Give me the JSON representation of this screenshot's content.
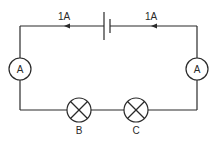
{
  "diagram": {
    "type": "circuit",
    "currents": [
      {
        "label": "1A",
        "position": "top-left",
        "direction": "left"
      },
      {
        "label": "1A",
        "position": "top-right",
        "direction": "left"
      }
    ],
    "ammeters": [
      {
        "label": "A",
        "position": "left"
      },
      {
        "label": "A",
        "position": "right"
      }
    ],
    "bulbs": [
      {
        "label": "B",
        "position": "bottom-left"
      },
      {
        "label": "C",
        "position": "bottom-right"
      }
    ],
    "battery": {
      "cells": 1,
      "position": "top-center"
    },
    "colors": {
      "line": "#2a2a2a",
      "background": "#ffffff"
    }
  }
}
